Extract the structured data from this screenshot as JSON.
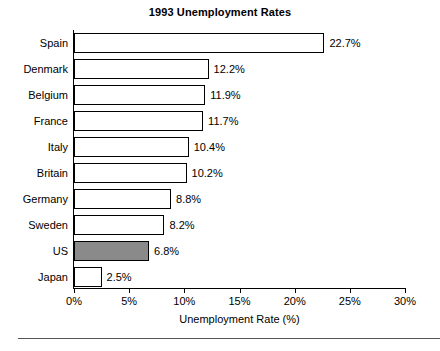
{
  "chart_data": {
    "type": "bar",
    "orientation": "horizontal",
    "title": "1993 Unemployment Rates",
    "xlabel": "Unemployment Rate (%)",
    "ylabel": "",
    "xlim": [
      0,
      30
    ],
    "xticks": [
      "0%",
      "5%",
      "10%",
      "15%",
      "20%",
      "25%",
      "30%"
    ],
    "xtick_values": [
      0,
      5,
      10,
      15,
      20,
      25,
      30
    ],
    "grid": false,
    "legend": "none",
    "categories": [
      "Spain",
      "Denmark",
      "Belgium",
      "France",
      "Italy",
      "Britain",
      "Germany",
      "Sweden",
      "US",
      "Japan"
    ],
    "values": [
      22.7,
      12.2,
      11.9,
      11.7,
      10.4,
      10.2,
      8.8,
      8.2,
      6.8,
      2.5
    ],
    "value_labels": [
      "22.7%",
      "12.2%",
      "11.9%",
      "11.7%",
      "10.4%",
      "10.2%",
      "8.8%",
      "8.2%",
      "6.8%",
      "2.5%"
    ],
    "highlighted_category": "US",
    "bars": [
      {
        "label": "Spain",
        "value": 22.7,
        "value_label": "22.7%",
        "highlight": false
      },
      {
        "label": "Denmark",
        "value": 12.2,
        "value_label": "12.2%",
        "highlight": false
      },
      {
        "label": "Belgium",
        "value": 11.9,
        "value_label": "11.9%",
        "highlight": false
      },
      {
        "label": "France",
        "value": 11.7,
        "value_label": "11.7%",
        "highlight": false
      },
      {
        "label": "Italy",
        "value": 10.4,
        "value_label": "10.4%",
        "highlight": false
      },
      {
        "label": "Britain",
        "value": 10.2,
        "value_label": "10.2%",
        "highlight": false
      },
      {
        "label": "Germany",
        "value": 8.8,
        "value_label": "8.8%",
        "highlight": false
      },
      {
        "label": "Sweden",
        "value": 8.2,
        "value_label": "8.2%",
        "highlight": false
      },
      {
        "label": "US",
        "value": 6.8,
        "value_label": "6.8%",
        "highlight": true
      },
      {
        "label": "Japan",
        "value": 2.5,
        "value_label": "2.5%",
        "highlight": false
      }
    ],
    "colors": {
      "bar_fill": "#ffffff",
      "bar_highlight_fill": "#8a8a8a",
      "bar_edge": "#000000",
      "axis": "#000000",
      "text": "#000000",
      "background": "#ffffff",
      "rule": "#555555"
    }
  }
}
